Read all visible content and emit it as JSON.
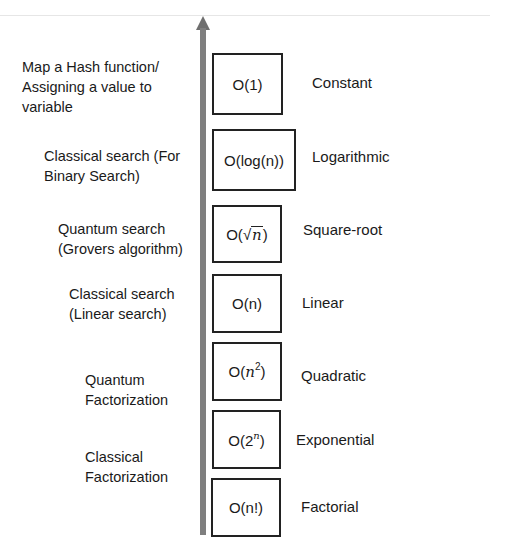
{
  "arrow": {
    "direction": "up",
    "color": "#7f7f7f"
  },
  "rows": [
    {
      "notation": "O(1)",
      "notation_parts": {
        "pre": "O(",
        "base": "1",
        "post": ")"
      },
      "name": "Constant",
      "example_lines": [
        "Map a Hash function/",
        "Assigning a value to",
        "variable"
      ]
    },
    {
      "notation": "O(log(n))",
      "notation_parts": {
        "pre": "O(log(n))"
      },
      "name": "Logarithmic",
      "example_lines": [
        "Classical search (For",
        "Binary Search)"
      ]
    },
    {
      "notation": "O(√n)",
      "notation_parts": {
        "pre": "O(",
        "sqrt_symbol": "√",
        "var": "n",
        "post": ")"
      },
      "name": "Square-root",
      "example_lines": [
        "Quantum search",
        "(Grovers algorithm)"
      ]
    },
    {
      "notation": "O(n)",
      "notation_parts": {
        "pre": "O(n)"
      },
      "name": "Linear",
      "example_lines": [
        "Classical search",
        "(Linear search)"
      ]
    },
    {
      "notation": "O(n^2)",
      "notation_parts": {
        "pre": "O(",
        "var": "n",
        "sup": "2",
        "post": ")"
      },
      "name": "Quadratic",
      "example_lines": [
        "Quantum",
        "Factorization"
      ]
    },
    {
      "notation": "O(2^n)",
      "notation_parts": {
        "pre": "O(2",
        "sup": "n",
        "post": ")"
      },
      "name": "Exponential",
      "example_lines": [
        "Classical",
        "Factorization"
      ]
    },
    {
      "notation": "O(n!)",
      "notation_parts": {
        "pre": "O(n!)"
      },
      "name": "Factorial",
      "example_lines": []
    }
  ]
}
